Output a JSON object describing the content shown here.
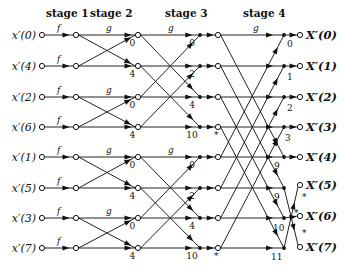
{
  "diagram": {
    "stages": [
      {
        "label": "stage 1",
        "x": 46,
        "y": 17
      },
      {
        "label": "stage 2",
        "x": 90,
        "y": 17
      },
      {
        "label": "stage 3",
        "x": 165,
        "y": 17
      },
      {
        "label": "stage 4",
        "x": 243,
        "y": 17
      }
    ],
    "row_y": [
      35,
      66,
      97,
      127,
      157,
      188,
      218,
      248
    ],
    "inputs": [
      {
        "label": "x′(0)",
        "pre": "x",
        "idx": "0"
      },
      {
        "label": "x′(4)",
        "pre": "x",
        "idx": "4"
      },
      {
        "label": "x′(2)",
        "pre": "x",
        "idx": "2"
      },
      {
        "label": "x′(6)",
        "pre": "x",
        "idx": "6"
      },
      {
        "label": "x′(1)",
        "pre": "x",
        "idx": "1"
      },
      {
        "label": "x′(5)",
        "pre": "x",
        "idx": "5"
      },
      {
        "label": "x′(3)",
        "pre": "x",
        "idx": "3"
      },
      {
        "label": "x′(7)",
        "pre": "x",
        "idx": "7"
      }
    ],
    "outputs": [
      {
        "label": "X′(0)",
        "row": 0
      },
      {
        "label": "X′(1)",
        "row": 1
      },
      {
        "label": "X′(2)",
        "row": 2
      },
      {
        "label": "X′(3)",
        "row": 3
      },
      {
        "label": "X′(4)",
        "row": 4
      },
      {
        "label": "X′(5)",
        "y": 185
      },
      {
        "label": "X′(6)",
        "y": 216
      },
      {
        "label": "X′(7)",
        "y": 247
      }
    ],
    "edge_labels": {
      "stage1": "f",
      "stage2": "g",
      "stage3": "g",
      "stage4": "g",
      "conj": "*"
    },
    "twiddles": {
      "stage2": [
        "0",
        "4",
        "0",
        "4",
        "0",
        "4",
        "0",
        "4"
      ],
      "stage3": [
        "0",
        "2",
        "4",
        "10",
        "0",
        "2",
        "4",
        "10"
      ],
      "stage4": [
        "0",
        "1",
        "2",
        "3",
        "9",
        "9",
        "10",
        "11"
      ]
    },
    "columns": {
      "input_circle": 42,
      "stage1_node": 76,
      "stage2_node": 138,
      "stage3_dot": 200,
      "stage3_circle": 218,
      "stage4_dot": 284,
      "output_circle": 300
    }
  }
}
